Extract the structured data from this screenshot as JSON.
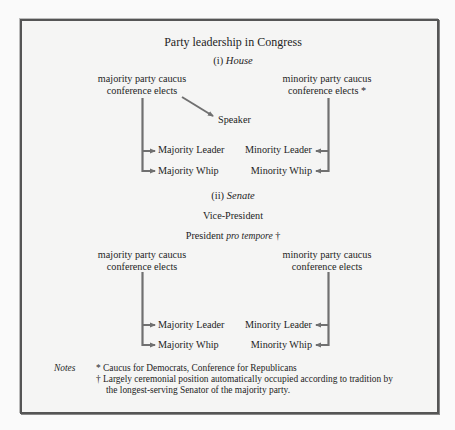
{
  "title": "Party leadership in Congress",
  "house": {
    "heading_num": "(i)",
    "heading_name": "House",
    "majority_source": [
      "majority party caucus",
      "conference elects"
    ],
    "minority_source": [
      "minority party caucus",
      "conference elects *"
    ],
    "speaker": "Speaker",
    "majority_leader": "Majority Leader",
    "majority_whip": "Majority Whip",
    "minority_leader": "Minority Leader",
    "minority_whip": "Minority Whip"
  },
  "senate": {
    "heading_num": "(ii)",
    "heading_name": "Senate",
    "vice_president": "Vice-President",
    "president_label": "President",
    "pro_tempore": "pro tempore",
    "dagger": "†",
    "majority_source": [
      "majority party caucus",
      "conference elects"
    ],
    "minority_source": [
      "minority party caucus",
      "conference elects"
    ],
    "majority_leader": "Majority Leader",
    "majority_whip": "Majority Whip",
    "minority_leader": "Minority Leader",
    "minority_whip": "Minority Whip"
  },
  "notes": {
    "label": "Notes",
    "items": [
      "* Caucus for Democrats, Conference for Republicans",
      "† Largely ceremonial position automatically occupied according to tradition by",
      "the longest-serving Senator of the majority party."
    ]
  },
  "colors": {
    "arrow": "#707070",
    "border": "#555555",
    "text": "#1e1e1e"
  }
}
